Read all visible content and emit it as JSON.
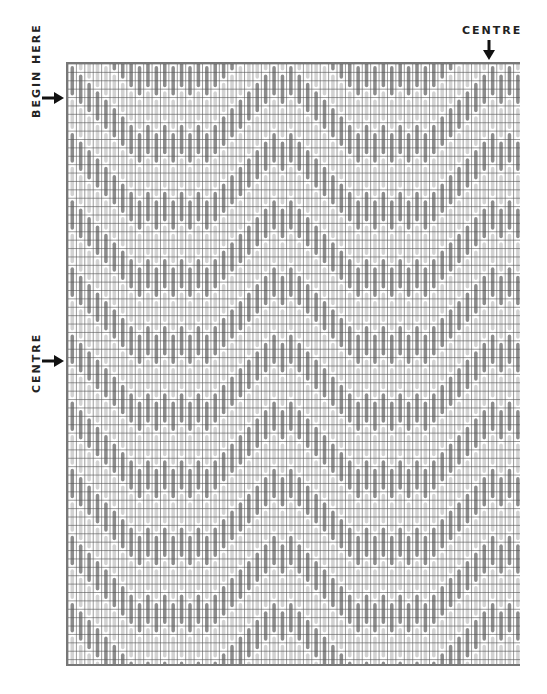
{
  "labels": {
    "begin_here": "BEGIN HERE",
    "centre_left": "CENTRE",
    "centre_top": "CENTRE"
  },
  "colors": {
    "dark_stitch": "#8c8c8c",
    "light_stitch": "#d2d2d2",
    "grid_line": "#555555",
    "background": "#ffffff"
  },
  "chart": {
    "columns": 54,
    "rows": 72,
    "stitch_length_rows": 4,
    "pattern": "bargello chevron"
  }
}
